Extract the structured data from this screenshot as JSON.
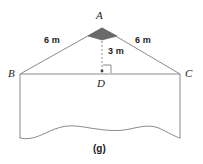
{
  "figure": {
    "caption": "(g)",
    "type": "geometry-diagram",
    "stroke_color": "#8a8a8a",
    "text_color": "#1d1d1d",
    "shaded_angle_color": "#6a6a6a",
    "background_color": "#ffffff"
  },
  "vertices": [
    {
      "id": "A",
      "label": "A",
      "x": 102,
      "y": 28,
      "role": "apex"
    },
    {
      "id": "B",
      "label": "B",
      "x": 20,
      "y": 74,
      "role": "base-left"
    },
    {
      "id": "C",
      "label": "C",
      "x": 180,
      "y": 74,
      "role": "base-right"
    },
    {
      "id": "D",
      "label": "D",
      "x": 102,
      "y": 74,
      "role": "base-midpoint-foot"
    }
  ],
  "measurements": [
    {
      "id": "ab",
      "label": "6 m",
      "value": 6,
      "unit": "m",
      "segment": "AB",
      "x": 44,
      "y": 38
    },
    {
      "id": "ac",
      "label": "6 m",
      "value": 6,
      "unit": "m",
      "segment": "AC",
      "x": 136,
      "y": 38
    },
    {
      "id": "ad",
      "label": "3 m",
      "value": 3,
      "unit": "m",
      "segment": "AD",
      "x": 108,
      "y": 47
    }
  ],
  "markers": {
    "apex_angle": {
      "name": "shaded-angle-marker",
      "at": "A",
      "shaded": true
    },
    "right_angle": {
      "name": "right-angle-marker",
      "at": "D",
      "degrees": 90
    },
    "altitude_line": {
      "name": "altitude-dashed-line",
      "from": "A",
      "to": "D",
      "style": "dashed"
    }
  },
  "wall": {
    "left_edge": "from B straight down",
    "right_edge": "from C straight down",
    "bottom_edge": "wavy torn edge"
  }
}
